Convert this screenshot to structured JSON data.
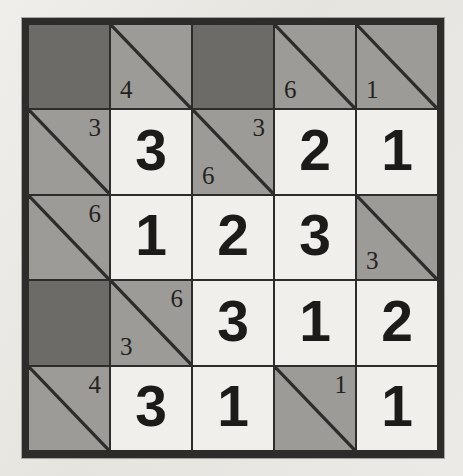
{
  "puzzle": {
    "type": "kakuro-style number grid",
    "rows": 5,
    "columns": 5,
    "colors": {
      "paper": "#e9e7e3",
      "border": "#2e2c2b",
      "block": "#6d6b68",
      "clue_cell": "#9d9b97",
      "answer_cell": "#f0efeb",
      "ink": "#1d1b19"
    },
    "cells": [
      {
        "id": "r1c1",
        "kind": "block",
        "across": "",
        "down": "",
        "value": ""
      },
      {
        "id": "r1c2",
        "kind": "clue",
        "across": "",
        "down": "4",
        "value": ""
      },
      {
        "id": "r1c3",
        "kind": "block",
        "across": "",
        "down": "",
        "value": ""
      },
      {
        "id": "r1c4",
        "kind": "clue",
        "across": "",
        "down": "6",
        "value": ""
      },
      {
        "id": "r1c5",
        "kind": "clue",
        "across": "",
        "down": "1",
        "value": ""
      },
      {
        "id": "r2c1",
        "kind": "clue",
        "across": "3",
        "down": "",
        "value": ""
      },
      {
        "id": "r2c2",
        "kind": "answer",
        "across": "",
        "down": "",
        "value": "3"
      },
      {
        "id": "r2c3",
        "kind": "clue",
        "across": "3",
        "down": "6",
        "value": ""
      },
      {
        "id": "r2c4",
        "kind": "answer",
        "across": "",
        "down": "",
        "value": "2"
      },
      {
        "id": "r2c5",
        "kind": "answer",
        "across": "",
        "down": "",
        "value": "1"
      },
      {
        "id": "r3c1",
        "kind": "clue",
        "across": "6",
        "down": "",
        "value": ""
      },
      {
        "id": "r3c2",
        "kind": "answer",
        "across": "",
        "down": "",
        "value": "1"
      },
      {
        "id": "r3c3",
        "kind": "answer",
        "across": "",
        "down": "",
        "value": "2"
      },
      {
        "id": "r3c4",
        "kind": "answer",
        "across": "",
        "down": "",
        "value": "3"
      },
      {
        "id": "r3c5",
        "kind": "clue",
        "across": "",
        "down": "3",
        "value": ""
      },
      {
        "id": "r4c1",
        "kind": "block",
        "across": "",
        "down": "",
        "value": ""
      },
      {
        "id": "r4c2",
        "kind": "clue",
        "across": "6",
        "down": "3",
        "value": ""
      },
      {
        "id": "r4c3",
        "kind": "answer",
        "across": "",
        "down": "",
        "value": "3"
      },
      {
        "id": "r4c4",
        "kind": "answer",
        "across": "",
        "down": "",
        "value": "1"
      },
      {
        "id": "r4c5",
        "kind": "answer",
        "across": "",
        "down": "",
        "value": "2"
      },
      {
        "id": "r5c1",
        "kind": "clue",
        "across": "4",
        "down": "",
        "value": ""
      },
      {
        "id": "r5c2",
        "kind": "answer",
        "across": "",
        "down": "",
        "value": "3"
      },
      {
        "id": "r5c3",
        "kind": "answer",
        "across": "",
        "down": "",
        "value": "1"
      },
      {
        "id": "r5c4",
        "kind": "clue",
        "across": "1",
        "down": "",
        "value": ""
      },
      {
        "id": "r5c5",
        "kind": "answer",
        "across": "",
        "down": "",
        "value": "1"
      }
    ]
  }
}
